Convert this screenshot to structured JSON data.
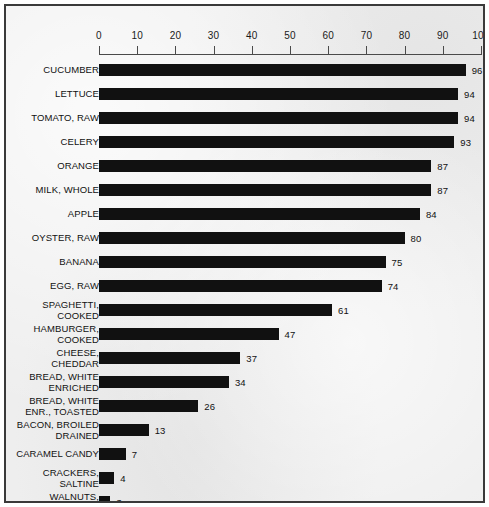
{
  "chart_data": {
    "type": "bar",
    "orientation": "horizontal",
    "title": "",
    "xlabel": "",
    "ylabel": "",
    "xlim": [
      0,
      100
    ],
    "grid": false,
    "legend": false,
    "axis_ticks": [
      0,
      10,
      20,
      30,
      40,
      50,
      60,
      70,
      80,
      90,
      100
    ],
    "axis_position": "top",
    "bar_color": "#111111",
    "background_color": "#eeeeee",
    "border_color": "#3a3a3a",
    "value_labels_shown": true,
    "categories": [
      "CUCUMBER",
      "LETTUCE",
      "TOMATO, RAW",
      "CELERY",
      "ORANGE",
      "MILK, WHOLE",
      "APPLE",
      "OYSTER, RAW",
      "BANANA",
      "EGG, RAW",
      "SPAGHETTI, COOKED",
      "HAMBURGER, COOKED",
      "CHEESE, CHEDDAR",
      "BREAD, WHITE ENRICHED",
      "BREAD, WHITE ENR., TOASTED",
      "BACON, BROILED DRAINED",
      "CARAMEL CANDY",
      "CRACKERS, SALTINE",
      "WALNUTS, ENGLISH",
      "LARD"
    ],
    "values": [
      96,
      94,
      94,
      93,
      87,
      87,
      84,
      80,
      75,
      74,
      61,
      47,
      37,
      34,
      26,
      13,
      7,
      4,
      3,
      0
    ],
    "rows": [
      {
        "label_lines": [
          "CUCUMBER"
        ],
        "value": 96
      },
      {
        "label_lines": [
          "LETTUCE"
        ],
        "value": 94
      },
      {
        "label_lines": [
          "TOMATO, RAW"
        ],
        "value": 94
      },
      {
        "label_lines": [
          "CELERY"
        ],
        "value": 93
      },
      {
        "label_lines": [
          "ORANGE"
        ],
        "value": 87
      },
      {
        "label_lines": [
          "MILK, WHOLE"
        ],
        "value": 87
      },
      {
        "label_lines": [
          "APPLE"
        ],
        "value": 84
      },
      {
        "label_lines": [
          "OYSTER, RAW"
        ],
        "value": 80
      },
      {
        "label_lines": [
          "BANANA"
        ],
        "value": 75
      },
      {
        "label_lines": [
          "EGG, RAW"
        ],
        "value": 74
      },
      {
        "label_lines": [
          "SPAGHETTI,",
          "COOKED"
        ],
        "value": 61
      },
      {
        "label_lines": [
          "HAMBURGER,",
          "COOKED"
        ],
        "value": 47
      },
      {
        "label_lines": [
          "CHEESE,",
          "CHEDDAR"
        ],
        "value": 37
      },
      {
        "label_lines": [
          "BREAD, WHITE",
          "ENRICHED"
        ],
        "value": 34
      },
      {
        "label_lines": [
          "BREAD, WHITE",
          "ENR., TOASTED"
        ],
        "value": 26
      },
      {
        "label_lines": [
          "BACON, BROILED",
          "DRAINED"
        ],
        "value": 13
      },
      {
        "label_lines": [
          "CARAMEL CANDY"
        ],
        "value": 7
      },
      {
        "label_lines": [
          "CRACKERS,",
          "SALTINE"
        ],
        "value": 4
      },
      {
        "label_lines": [
          "WALNUTS,",
          "ENGLISH"
        ],
        "value": 3
      },
      {
        "label_lines": [
          "LARD"
        ],
        "value": 0
      }
    ]
  }
}
